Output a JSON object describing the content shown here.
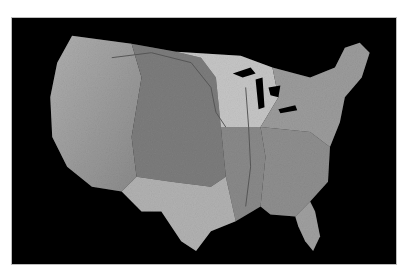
{
  "map": {
    "subject": "Shaded relief map of the contiguous United States",
    "style": "grayscale relief",
    "background": "#000000",
    "border_color": "#bdbdbd",
    "regions": [
      {
        "name": "west-mountains",
        "color": "#9a9a9a"
      },
      {
        "name": "great-plains",
        "color": "#7d7d7d"
      },
      {
        "name": "upper-midwest",
        "color": "#c8c8c8"
      },
      {
        "name": "mississippi-basin",
        "color": "#8a8a8a"
      },
      {
        "name": "texas",
        "color": "#b4b4b4"
      },
      {
        "name": "southeast",
        "color": "#8f8f8f"
      },
      {
        "name": "northeast",
        "color": "#9c9c9c"
      },
      {
        "name": "florida",
        "color": "#a0a0a0"
      }
    ],
    "features": [
      "rivers",
      "great-lakes"
    ]
  }
}
